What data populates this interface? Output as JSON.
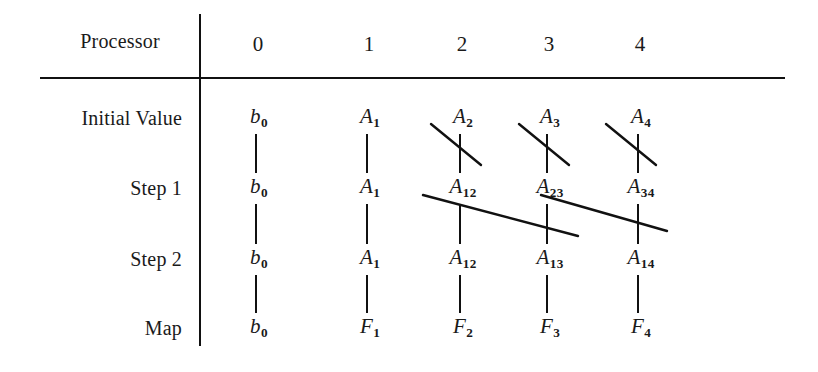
{
  "figure": {
    "row_header_label": "Processor",
    "columns": [
      "0",
      "1",
      "2",
      "3",
      "4"
    ],
    "rows": [
      {
        "label": "Initial Value",
        "cells": [
          {
            "base": "b",
            "sub": "0",
            "style": "lower"
          },
          {
            "base": "A",
            "sub": "1",
            "style": "upper"
          },
          {
            "base": "A",
            "sub": "2",
            "style": "upper"
          },
          {
            "base": "A",
            "sub": "3",
            "style": "upper"
          },
          {
            "base": "A",
            "sub": "4",
            "style": "upper"
          }
        ]
      },
      {
        "label": "Step 1",
        "cells": [
          {
            "base": "b",
            "sub": "0",
            "style": "lower"
          },
          {
            "base": "A",
            "sub": "1",
            "style": "upper"
          },
          {
            "base": "A",
            "sub": "12",
            "style": "upper"
          },
          {
            "base": "A",
            "sub": "23",
            "style": "upper"
          },
          {
            "base": "A",
            "sub": "34",
            "style": "upper"
          }
        ]
      },
      {
        "label": "Step 2",
        "cells": [
          {
            "base": "b",
            "sub": "0",
            "style": "lower"
          },
          {
            "base": "A",
            "sub": "1",
            "style": "upper"
          },
          {
            "base": "A",
            "sub": "12",
            "style": "upper"
          },
          {
            "base": "A",
            "sub": "13",
            "style": "upper"
          },
          {
            "base": "A",
            "sub": "14",
            "style": "upper"
          }
        ]
      },
      {
        "label": "Map",
        "cells": [
          {
            "base": "b",
            "sub": "0",
            "style": "lower"
          },
          {
            "base": "F",
            "sub": "1",
            "style": "upper"
          },
          {
            "base": "F",
            "sub": "2",
            "style": "upper"
          },
          {
            "base": "F",
            "sub": "3",
            "style": "upper"
          },
          {
            "base": "F",
            "sub": "4",
            "style": "upper"
          }
        ]
      }
    ],
    "ink_color": "#111111",
    "background_color": "#ffffff",
    "geometry": {
      "column_x": [
        258,
        369,
        462,
        549,
        640
      ],
      "row_y": [
        118,
        188,
        259,
        328
      ],
      "vertical_rule_x": 200,
      "horizontal_rule_y": 78
    },
    "vertical_connectors": [
      {
        "col": 0,
        "from_row": 0,
        "to_row": 1
      },
      {
        "col": 0,
        "from_row": 1,
        "to_row": 2
      },
      {
        "col": 0,
        "from_row": 2,
        "to_row": 3
      },
      {
        "col": 1,
        "from_row": 0,
        "to_row": 1
      },
      {
        "col": 1,
        "from_row": 1,
        "to_row": 2
      },
      {
        "col": 1,
        "from_row": 2,
        "to_row": 3
      },
      {
        "col": 2,
        "from_row": 0,
        "to_row": 1
      },
      {
        "col": 2,
        "from_row": 1,
        "to_row": 2
      },
      {
        "col": 2,
        "from_row": 2,
        "to_row": 3
      },
      {
        "col": 3,
        "from_row": 0,
        "to_row": 1
      },
      {
        "col": 3,
        "from_row": 1,
        "to_row": 2
      },
      {
        "col": 3,
        "from_row": 2,
        "to_row": 3
      },
      {
        "col": 4,
        "from_row": 0,
        "to_row": 1
      },
      {
        "col": 4,
        "from_row": 1,
        "to_row": 2
      },
      {
        "col": 4,
        "from_row": 2,
        "to_row": 3
      }
    ],
    "diagonal_connectors": [
      {
        "label": "A1-to-A12",
        "x1": 431,
        "y1": 124,
        "x2": 481,
        "y2": 165
      },
      {
        "label": "A2-to-A23",
        "x1": 519,
        "y1": 124,
        "x2": 569,
        "y2": 165
      },
      {
        "label": "A3-to-A34",
        "x1": 606,
        "y1": 124,
        "x2": 656,
        "y2": 165
      },
      {
        "label": "A1-to-A13",
        "x1": 423,
        "y1": 195,
        "x2": 578,
        "y2": 236
      },
      {
        "label": "A12-to-A14",
        "x1": 541,
        "y1": 195,
        "x2": 667,
        "y2": 231
      }
    ]
  }
}
